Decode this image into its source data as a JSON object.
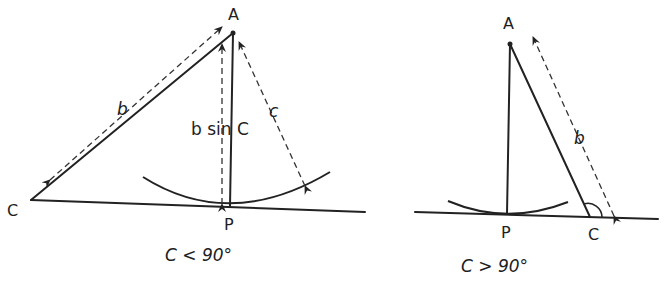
{
  "left_figure": {
    "vertex_A_label": "A",
    "vertex_C_label": "C",
    "foot_P_label": "P",
    "side_b_label": "b",
    "side_c_label": "c",
    "height_label": "b sin C",
    "condition_label": "C < 90°"
  },
  "right_figure": {
    "vertex_A_label": "A",
    "vertex_C_label": "C",
    "foot_P_label": "P",
    "side_b_label": "b",
    "condition_label": "C > 90°"
  },
  "colors": {
    "ink": "#222222",
    "background": "#ffffff"
  }
}
